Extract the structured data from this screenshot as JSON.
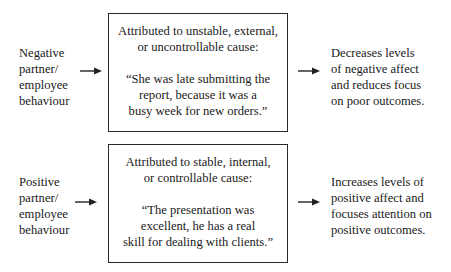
{
  "rows": [
    {
      "input_label": "Negative\npartner/\nemployee\nbehaviour",
      "box_title": "Attributed to unstable, external,\nor uncontrollable cause:",
      "box_quote": "“She was late submitting the\nreport, because it was a\nbusy week for new orders.”",
      "outcome": "Decreases levels\nof negative affect\nand reduces focus\non poor outcomes."
    },
    {
      "input_label": "Positive\npartner/\nemployee\nbehaviour",
      "box_title": "Attributed to stable, internal,\nor controllable cause:",
      "box_quote": "“The presentation was\nexcellent, he has a real\nskill for dealing with clients.”",
      "outcome": "Increases levels of\npositive affect and\nfocuses attention on\npositive outcomes."
    }
  ]
}
